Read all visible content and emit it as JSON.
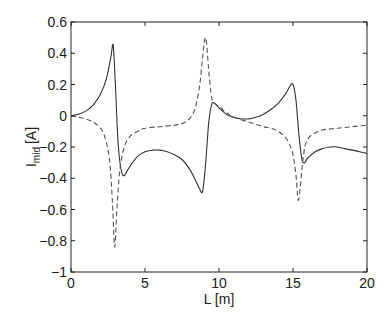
{
  "chart_data": {
    "type": "line",
    "title": "",
    "xlabel": "L [m]",
    "ylabel": "I",
    "ylabel_sub": "mid",
    "ylabel_unit": "[A]",
    "xlim": [
      0,
      20
    ],
    "ylim": [
      -1,
      0.6
    ],
    "xticks": [
      0,
      5,
      10,
      15,
      20
    ],
    "xtick_labels": [
      "0",
      "5",
      "10",
      "15",
      "20"
    ],
    "yticks": [
      -1,
      -0.8,
      -0.6,
      -0.4,
      -0.2,
      0,
      0.2,
      0.4,
      0.6
    ],
    "ytick_labels": [
      "−1",
      "−0.8",
      "−0.6",
      "−0.4",
      "−0.2",
      "0",
      "0.2",
      "0.4",
      "0.6"
    ],
    "grid": false,
    "legend": null,
    "series": [
      {
        "name": "solid",
        "style": "solid",
        "color": "#333333",
        "x": [
          0,
          0.5,
          1.0,
          1.5,
          2.0,
          2.4,
          2.7,
          2.85,
          3.0,
          3.2,
          3.5,
          4.0,
          4.5,
          5.0,
          5.5,
          6.0,
          6.5,
          7.0,
          7.5,
          8.0,
          8.4,
          8.7,
          8.9,
          9.1,
          9.3,
          9.5,
          9.7,
          10.0,
          10.5,
          11.0,
          11.5,
          12.0,
          12.5,
          13.0,
          13.5,
          14.0,
          14.5,
          14.8,
          15.0,
          15.2,
          15.4,
          15.6,
          15.8,
          16.0,
          16.5,
          17.0,
          17.5,
          18.0,
          18.5,
          19.0,
          19.5,
          20.0
        ],
        "y": [
          0,
          0.01,
          0.03,
          0.07,
          0.14,
          0.24,
          0.38,
          0.45,
          0.2,
          -0.2,
          -0.38,
          -0.32,
          -0.26,
          -0.23,
          -0.22,
          -0.22,
          -0.23,
          -0.25,
          -0.28,
          -0.34,
          -0.41,
          -0.47,
          -0.48,
          -0.3,
          -0.05,
          0.07,
          0.08,
          0.05,
          0.01,
          -0.01,
          -0.02,
          -0.02,
          -0.01,
          0.01,
          0.04,
          0.08,
          0.14,
          0.19,
          0.2,
          0.1,
          -0.12,
          -0.28,
          -0.3,
          -0.27,
          -0.23,
          -0.21,
          -0.2,
          -0.2,
          -0.21,
          -0.22,
          -0.23,
          -0.24
        ]
      },
      {
        "name": "dashed",
        "style": "dashed",
        "color": "#555555",
        "x": [
          0,
          0.5,
          1.0,
          1.5,
          2.0,
          2.3,
          2.6,
          2.8,
          2.95,
          3.1,
          3.3,
          3.6,
          4.0,
          4.5,
          5.0,
          6.0,
          7.0,
          7.5,
          8.0,
          8.4,
          8.7,
          8.9,
          9.1,
          9.3,
          9.5,
          9.7,
          10.0,
          10.5,
          11.0,
          12.0,
          13.0,
          13.5,
          14.0,
          14.5,
          14.8,
          15.0,
          15.2,
          15.35,
          15.5,
          15.65,
          15.8,
          16.0,
          16.3,
          16.7,
          17.0,
          18.0,
          19.0,
          20.0
        ],
        "y": [
          0,
          -0.01,
          -0.02,
          -0.04,
          -0.08,
          -0.14,
          -0.28,
          -0.55,
          -0.84,
          -0.6,
          -0.35,
          -0.2,
          -0.13,
          -0.1,
          -0.08,
          -0.07,
          -0.06,
          -0.05,
          -0.02,
          0.05,
          0.2,
          0.38,
          0.5,
          0.3,
          0.12,
          0.08,
          0.06,
          0.02,
          -0.01,
          -0.04,
          -0.07,
          -0.08,
          -0.1,
          -0.14,
          -0.19,
          -0.25,
          -0.38,
          -0.54,
          -0.45,
          -0.3,
          -0.2,
          -0.15,
          -0.12,
          -0.1,
          -0.09,
          -0.08,
          -0.07,
          -0.06
        ]
      }
    ]
  },
  "layout": {
    "plot_left": 71,
    "plot_right": 367,
    "plot_top": 22,
    "plot_bottom": 272
  }
}
